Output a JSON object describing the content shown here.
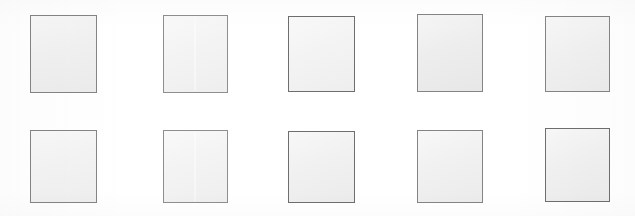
{
  "page": {
    "width": 635,
    "height": 216,
    "background_color": "#ffffff"
  },
  "palette": {
    "box_fill": "#efefef",
    "box_fill_dark": "#ebebeb",
    "box_fill_light": "#f2f2f2",
    "box_border": "#848484",
    "box_border_shadow": "#6f6f6f",
    "canvas": "#ffffff"
  },
  "grid": {
    "rows": 2,
    "columns": 5,
    "total_boxes": 10,
    "row_tops": [
      15,
      130
    ],
    "row_heights": [
      78,
      73
    ],
    "column_lefts": [
      30,
      163,
      288,
      417,
      545
    ],
    "column_widths": [
      67,
      65,
      67,
      66,
      65
    ]
  },
  "boxes": [
    {
      "id": "box-r1c1",
      "row": 1,
      "column": 1,
      "x": 30,
      "y": 15,
      "width": 67,
      "height": 78,
      "fill": "#efefef",
      "border": "#848484",
      "label": "",
      "crease": false,
      "tint": "",
      "edge": ""
    },
    {
      "id": "box-r1c2",
      "row": 1,
      "column": 2,
      "x": 163,
      "y": 15,
      "width": 65,
      "height": 78,
      "fill": "#f2f2f2",
      "border": "#8e8e8e",
      "label": "",
      "crease": true,
      "tint": "tint-light",
      "edge": "edge-soft"
    },
    {
      "id": "box-r1c3",
      "row": 1,
      "column": 3,
      "x": 288,
      "y": 16,
      "width": 67,
      "height": 76,
      "fill": "#f2f2f2",
      "border": "#6e6e6e",
      "label": "",
      "crease": false,
      "tint": "tint-light",
      "edge": "edge-hard"
    },
    {
      "id": "box-r1c4",
      "row": 1,
      "column": 4,
      "x": 417,
      "y": 14,
      "width": 66,
      "height": 78,
      "fill": "#ebebeb",
      "border": "#848484",
      "label": "",
      "crease": false,
      "tint": "tint-dark",
      "edge": ""
    },
    {
      "id": "box-r1c5",
      "row": 1,
      "column": 5,
      "x": 545,
      "y": 16,
      "width": 65,
      "height": 76,
      "fill": "#efefef",
      "border": "#848484",
      "label": "",
      "crease": false,
      "tint": "",
      "edge": ""
    },
    {
      "id": "box-r2c1",
      "row": 2,
      "column": 1,
      "x": 30,
      "y": 130,
      "width": 67,
      "height": 73,
      "fill": "#f2f2f2",
      "border": "#848484",
      "label": "",
      "crease": false,
      "tint": "tint-light",
      "edge": ""
    },
    {
      "id": "box-r2c2",
      "row": 2,
      "column": 2,
      "x": 163,
      "y": 130,
      "width": 65,
      "height": 73,
      "fill": "#f2f2f2",
      "border": "#8e8e8e",
      "label": "",
      "crease": true,
      "tint": "tint-light",
      "edge": "edge-soft"
    },
    {
      "id": "box-r2c3",
      "row": 2,
      "column": 3,
      "x": 288,
      "y": 131,
      "width": 67,
      "height": 72,
      "fill": "#efefef",
      "border": "#6e6e6e",
      "label": "",
      "crease": false,
      "tint": "",
      "edge": "edge-hard"
    },
    {
      "id": "box-r2c4",
      "row": 2,
      "column": 4,
      "x": 417,
      "y": 130,
      "width": 66,
      "height": 73,
      "fill": "#efefef",
      "border": "#848484",
      "label": "",
      "crease": false,
      "tint": "",
      "edge": ""
    },
    {
      "id": "box-r2c5",
      "row": 2,
      "column": 5,
      "x": 545,
      "y": 128,
      "width": 65,
      "height": 74,
      "fill": "#efefef",
      "border": "#6e6e6e",
      "label": "",
      "crease": false,
      "tint": "",
      "edge": "edge-hard"
    }
  ]
}
